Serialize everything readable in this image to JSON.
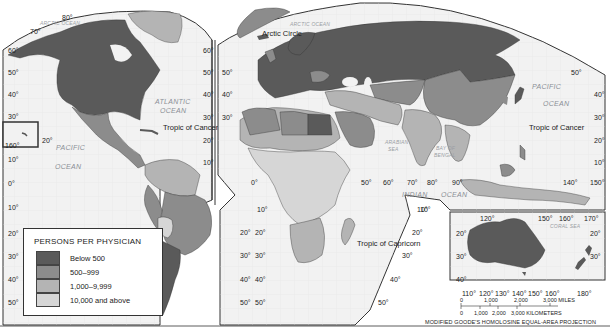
{
  "legend": {
    "title": "PERSONS PER PHYSICIAN",
    "items": [
      {
        "label": "Below 500",
        "color": "#5a5a5a"
      },
      {
        "label": "500–999",
        "color": "#8c8c8c"
      },
      {
        "label": "1,000–9,999",
        "color": "#b4b4b4"
      },
      {
        "label": "10,000 and above",
        "color": "#d6d6d6"
      }
    ]
  },
  "colors": {
    "ocean": "#f2f2f2",
    "border": "#333333",
    "level1": "#5a5a5a",
    "level2": "#8c8c8c",
    "level3": "#b4b4b4",
    "level4": "#d6d6d6"
  },
  "oceans": {
    "arctic_left": "ARCTIC OCEAN",
    "arctic_right": "ARCTIC OCEAN",
    "atlantic_1": "ATLANTIC",
    "atlantic_2": "OCEAN",
    "pacific_left_1": "PACIFIC",
    "pacific_left_2": "OCEAN",
    "pacific_right_1": "PACIFIC",
    "pacific_right_2": "OCEAN",
    "indian_1": "INDIAN",
    "indian_2": "OCEAN",
    "arabian_1": "ARABIAN",
    "arabian_2": "SEA",
    "bengal_1": "BAY OF",
    "bengal_2": "BENGAL",
    "coral": "CORAL SEA"
  },
  "lines": {
    "arctic_circle": "Arctic Circle",
    "tropic_cancer_left": "Tropic of Cancer",
    "tropic_cancer_right": "Tropic of Cancer",
    "tropic_capricorn": "Tropic of Capricorn"
  },
  "degrees": {
    "top_80": "80°",
    "top_70": "70°",
    "left_col": [
      "60°",
      "50°",
      "40°",
      "30°",
      "20°",
      "10°",
      "0°",
      "10°",
      "20°",
      "30°",
      "40°",
      "50°"
    ],
    "mid_left_col": [
      "60°",
      "50°",
      "40°",
      "30°",
      "20°",
      "10°"
    ],
    "mid_left_lower": [
      "20°",
      "30°",
      "40°",
      "50°"
    ],
    "mid_right_col": [
      "50°",
      "40°",
      "30°"
    ],
    "mid_right_lower": [
      "10°",
      "20°",
      "30°",
      "40°",
      "50°"
    ],
    "hawaii_160": "160°",
    "hawaii_20": "20°",
    "equator_0": "0°",
    "lon_50": "50°",
    "lon_60": "60°",
    "lon_70": "70°",
    "lon_80": "80°",
    "lon_90": "90°",
    "lon_140": "140°",
    "lon_150": "150°",
    "lat_10_indian": "10°",
    "right_col": [
      "50°",
      "40°",
      "30°",
      "20°",
      "10°"
    ],
    "africa_right": [
      "10°",
      "20°",
      "30°",
      "40°",
      "50°"
    ],
    "aus_top": [
      "120°",
      "150°",
      "160°",
      "170°"
    ],
    "aus_bottom": [
      "110°",
      "120°",
      "130°",
      "140°",
      "150°",
      "160°",
      "180°"
    ],
    "aus_left": [
      "20°",
      "30°",
      "40°"
    ],
    "aus_right": [
      "20°",
      "30°"
    ]
  },
  "scale": {
    "miles": [
      "0",
      "1,000",
      "2,000",
      "3,000 MILES"
    ],
    "km": [
      "0",
      "1,000",
      "2,000",
      "3,000 KILOMETERS"
    ]
  },
  "projection": "MODIFIED GOODE'S HOMOLOSINE EQUAL-AREA PROJECTION"
}
